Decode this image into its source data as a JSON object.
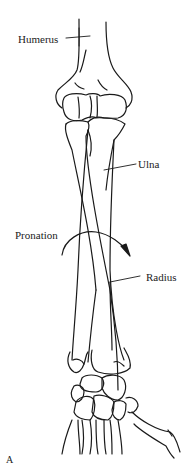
{
  "labels": {
    "humerus": "Humerus",
    "ulna": "Ulna",
    "pronation": "Pronation",
    "radius": "Radius",
    "panel": "A"
  },
  "colors": {
    "stroke": "#1a1a1a",
    "background": "#ffffff"
  }
}
